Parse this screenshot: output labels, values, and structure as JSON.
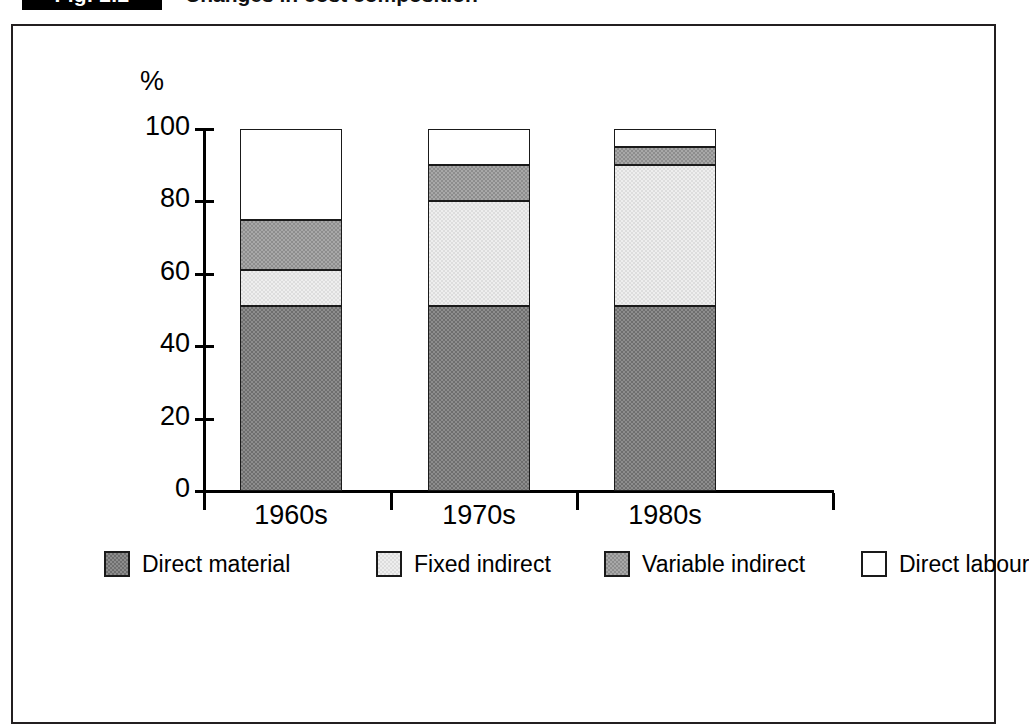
{
  "figure": {
    "tag": "Fig. 2.2",
    "caption": "Changes in cost composition"
  },
  "chart_data": {
    "type": "bar",
    "stacked": true,
    "title": "Changes in cost composition",
    "xlabel": "",
    "ylabel": "%",
    "y_unit": "%",
    "ylim": [
      0,
      100
    ],
    "yticks": [
      0,
      20,
      40,
      60,
      80,
      100
    ],
    "grid": false,
    "legend_position": "bottom",
    "categories": [
      "1960s",
      "1970s",
      "1980s"
    ],
    "series": [
      {
        "name": "Direct material",
        "color": "#8d8d8d",
        "values": [
          51,
          51,
          51
        ]
      },
      {
        "name": "Fixed indirect",
        "color": "#eeeeee",
        "values": [
          10,
          29,
          39
        ]
      },
      {
        "name": "Variable indirect",
        "color": "#a8a8a8",
        "values": [
          14,
          10,
          5
        ]
      },
      {
        "name": "Direct labour",
        "color": "#ffffff",
        "values": [
          25,
          10,
          5
        ]
      }
    ],
    "cumulative_tops": {
      "1960s": [
        51,
        61,
        75,
        100
      ],
      "1970s": [
        51,
        80,
        90,
        100
      ],
      "1980s": [
        51,
        90,
        95,
        100
      ]
    }
  },
  "axis": {
    "y_unit_label": "%",
    "tick_labels": [
      "100",
      "80",
      "60",
      "40",
      "20",
      "0"
    ],
    "category_labels": [
      "1960s",
      "1970s",
      "1980s"
    ]
  },
  "legend": {
    "items": [
      {
        "label": "Direct material",
        "swatch": "dark-gray-dither"
      },
      {
        "label": "Fixed indirect",
        "swatch": "light-gray-dither"
      },
      {
        "label": "Variable indirect",
        "swatch": "medium-gray-dither"
      },
      {
        "label": "Direct labour",
        "swatch": "white"
      }
    ]
  }
}
